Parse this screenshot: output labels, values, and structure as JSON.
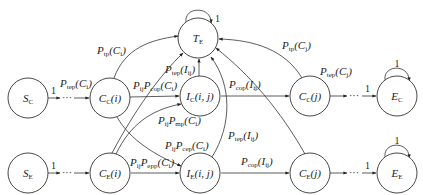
{
  "diagram": {
    "type": "state-transition-diagram",
    "nodes": {
      "T_E": {
        "main": "T",
        "sub": "E",
        "tail": ""
      },
      "S_C": {
        "main": "S",
        "sub": "C",
        "tail": ""
      },
      "C_C_i": {
        "main": "C",
        "sub": "C",
        "tail": "(i)"
      },
      "I_C_ij": {
        "main": "I",
        "sub": "C",
        "tail": "(i, j)"
      },
      "C_C_j": {
        "main": "C",
        "sub": "C",
        "tail": "(j)"
      },
      "E_C": {
        "main": "E",
        "sub": "C",
        "tail": ""
      },
      "S_E": {
        "main": "S",
        "sub": "E",
        "tail": ""
      },
      "C_E_i": {
        "main": "C",
        "sub": "E",
        "tail": "(i)"
      },
      "I_E_ij": {
        "main": "I",
        "sub": "E",
        "tail": "(i, j)"
      },
      "C_E_j": {
        "main": "C",
        "sub": "E",
        "tail": "(j)"
      },
      "E_E": {
        "main": "E",
        "sub": "E",
        "tail": ""
      }
    },
    "edge_labels": {
      "te_self": "1",
      "ec_self": "1",
      "ee_self": "1",
      "sc_out": "1",
      "se_out": "1",
      "cc_j_out": "1",
      "ce_j_out": "1",
      "dots": "···",
      "p_tep_ci": {
        "p": "P",
        "s": "tep",
        "arg": "(C",
        "argsub": "i",
        "close": ")"
      },
      "p_tp_ci": {
        "p": "P",
        "s": "tp",
        "arg": "(C",
        "argsub": "i",
        "close": ")"
      },
      "p_ij_p_cop_ci": {
        "pre": "P",
        "presub": "ij",
        "p": "P",
        "s": "cop",
        "arg": "(C",
        "argsub": "i",
        "close": ")"
      },
      "p_tep_iij_top": {
        "p": "P",
        "s": "tep",
        "arg": "(I",
        "argsub": "ij",
        "close": ")"
      },
      "p_cop_iij_top": {
        "p": "P",
        "s": "cop",
        "arg": "(I",
        "argsub": "ij",
        "close": ")"
      },
      "p_tp_cj": {
        "p": "P",
        "s": "tp",
        "arg": "(C",
        "argsub": "j",
        "close": ")"
      },
      "p_tep_cj": {
        "p": "P",
        "s": "tep",
        "arg": "(C",
        "argsub": "j",
        "close": ")"
      },
      "p_ij_p_mp_ci": {
        "pre": "P",
        "presub": "ij",
        "p": "P",
        "s": "mp",
        "arg": "(C",
        "argsub": "i",
        "close": ")"
      },
      "p_ij_p_cep_ci": {
        "pre": "P",
        "presub": "ij",
        "p": "P",
        "s": "cep",
        "arg": "(C",
        "argsub": "i",
        "close": ")"
      },
      "p_ij_p_epp_ci": {
        "pre": "P",
        "presub": "ij",
        "p": "P",
        "s": "epp",
        "arg": "(C",
        "argsub": "i",
        "close": ")"
      },
      "p_tep_iij_mid": {
        "p": "P",
        "s": "tep",
        "arg": "(I",
        "argsub": "ij",
        "close": ")"
      },
      "p_cop_iij_bot": {
        "p": "P",
        "s": "cop",
        "arg": "(I",
        "argsub": "ij",
        "close": ")"
      }
    },
    "colors": {
      "stroke": "#333333",
      "text": "#222222",
      "background": "#ffffff"
    }
  }
}
